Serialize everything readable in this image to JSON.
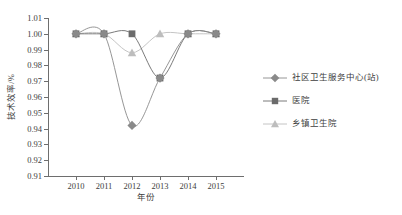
{
  "chart_data": {
    "type": "line",
    "title": "",
    "xlabel": "年份",
    "ylabel": "技术效率/%",
    "categories": [
      "2010",
      "2011",
      "2012",
      "2013",
      "2014",
      "2015"
    ],
    "x": [
      2010,
      2011,
      2012,
      2013,
      2014,
      2015
    ],
    "ylim": [
      0.91,
      1.01
    ],
    "yticks": [
      "1.01",
      "1.00",
      "0.99",
      "0.98",
      "0.97",
      "0.96",
      "0.95",
      "0.94",
      "0.93",
      "0.92",
      "0.91"
    ],
    "ytick_values": [
      1.01,
      1.0,
      0.99,
      0.98,
      0.97,
      0.96,
      0.95,
      0.94,
      0.93,
      0.92,
      0.91
    ],
    "grid": false,
    "legend_position": "right",
    "series": [
      {
        "name": "社区卫生服务中心(站)",
        "marker": "diamond",
        "color": "#8a8a8a",
        "values": [
          1.0,
          1.0,
          0.942,
          0.972,
          1.0,
          1.0
        ]
      },
      {
        "name": "医院",
        "marker": "square",
        "color": "#6b6b6b",
        "values": [
          1.0,
          1.0,
          1.0,
          0.972,
          1.0,
          1.0
        ]
      },
      {
        "name": "乡镇卫生院",
        "marker": "triangle",
        "color": "#bdbdbd",
        "values": [
          1.0,
          1.0,
          0.988,
          1.0,
          1.0,
          1.0
        ]
      }
    ]
  },
  "axis": {
    "line_color": "#6e6e6e",
    "text_color": "#3d3d3d"
  }
}
